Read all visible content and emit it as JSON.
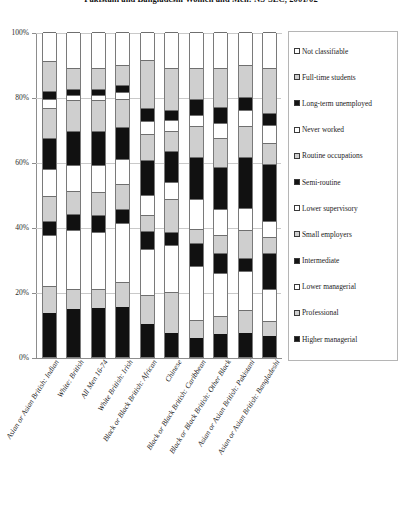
{
  "chart_data": {
    "type": "bar",
    "subtype": "stacked-100-percent-vertical",
    "title": "Pakistani and Bangladeshi Women and Men: NS-SEC, 2001/02",
    "xlabel": "",
    "ylabel": "",
    "ylim": [
      0,
      100
    ],
    "ytick_labels": [
      "0%",
      "20%",
      "40%",
      "60%",
      "80%",
      "100%"
    ],
    "ytick_values": [
      0,
      20,
      40,
      60,
      80,
      100
    ],
    "grid": true,
    "legend_position": "right",
    "categories": [
      "Asian or Asian British: Indian",
      "White: British",
      "All Men 16-74",
      "White British: Irish",
      "Black or Black British: African",
      "Chinese",
      "Black or Black British: Caribbean",
      "Black or Black British: Other Black",
      "Asian or Asian British: Pakistani",
      "Asian or Asian British: Bangladeshi"
    ],
    "series": [
      {
        "name": "Higher managerial",
        "fill": "dark",
        "values": [
          13.5,
          14.8,
          15.1,
          15.4,
          10.2,
          7.5,
          6.0,
          7.0,
          7.5,
          6.5
        ]
      },
      {
        "name": "Professional",
        "fill": "grey",
        "values": [
          8.5,
          6.2,
          5.8,
          7.7,
          9.0,
          12.5,
          5.5,
          5.5,
          7.0,
          4.5
        ]
      },
      {
        "name": "Lower managerial",
        "fill": "light",
        "values": [
          15.5,
          18.0,
          17.5,
          18.0,
          14.0,
          14.5,
          16.5,
          13.5,
          12.0,
          10.0
        ]
      },
      {
        "name": "Intermediate",
        "fill": "dark",
        "values": [
          4.5,
          5.0,
          5.2,
          4.5,
          5.5,
          4.0,
          7.0,
          6.0,
          4.0,
          11.0
        ]
      },
      {
        "name": "Small employers",
        "fill": "grey",
        "values": [
          7.5,
          7.0,
          7.2,
          7.5,
          5.0,
          10.0,
          4.5,
          5.5,
          8.5,
          5.0
        ]
      },
      {
        "name": "Lower supervisory",
        "fill": "light",
        "values": [
          8.5,
          8.0,
          8.2,
          7.8,
          6.0,
          5.5,
          9.0,
          8.0,
          7.0,
          5.0
        ]
      },
      {
        "name": "Semi-routine",
        "fill": "dark",
        "values": [
          9.5,
          10.5,
          10.5,
          10.0,
          11.0,
          9.5,
          13.0,
          13.0,
          15.5,
          17.5
        ]
      },
      {
        "name": "Routine occupations",
        "fill": "grey",
        "values": [
          9.0,
          9.5,
          9.5,
          8.5,
          8.0,
          6.0,
          9.5,
          9.0,
          9.5,
          6.5
        ]
      },
      {
        "name": "Never worked",
        "fill": "light",
        "values": [
          3.0,
          1.5,
          1.5,
          2.0,
          4.0,
          3.5,
          3.5,
          4.5,
          5.0,
          5.5
        ]
      },
      {
        "name": "Long-term unemployed",
        "fill": "dark",
        "values": [
          2.5,
          2.0,
          2.0,
          2.2,
          4.0,
          3.0,
          5.0,
          5.0,
          4.0,
          3.5
        ]
      },
      {
        "name": "Full-time students",
        "fill": "grey",
        "values": [
          9.0,
          6.5,
          6.5,
          6.4,
          14.8,
          13.0,
          9.5,
          12.0,
          10.0,
          14.0
        ]
      },
      {
        "name": "Not classifiable",
        "fill": "light",
        "values": [
          9.0,
          11.0,
          11.0,
          10.0,
          8.5,
          11.0,
          11.0,
          11.0,
          10.0,
          11.0
        ]
      }
    ],
    "legend_order": [
      "Not classifiable",
      "Full-time students",
      "Long-term unemployed",
      "Never worked",
      "Routine occupations",
      "Semi-routine",
      "Lower supervisory",
      "Small employers",
      "Intermediate",
      "Lower managerial",
      "Professional",
      "Higher managerial"
    ],
    "legend_fills": [
      "light",
      "grey",
      "dark",
      "light",
      "grey",
      "dark",
      "light",
      "grey",
      "dark",
      "light",
      "grey",
      "dark"
    ],
    "colors": {
      "light": "#ffffff",
      "grey": "#cfcfcf",
      "dark": "#111111",
      "grid": "#c9c9c9",
      "axis": "#8d8d8d",
      "text": "#1a1a1a"
    }
  }
}
